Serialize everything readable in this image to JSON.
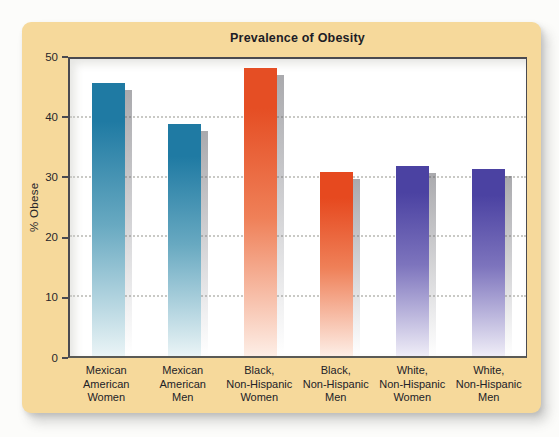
{
  "page": {
    "background": "#fcfcfa",
    "card_background": "#f6d99b"
  },
  "chart_data": {
    "type": "bar",
    "title": "Prevalence of Obesity",
    "xlabel": "",
    "ylabel": "% Obese",
    "ylim": [
      0,
      50
    ],
    "yticks": [
      0,
      10,
      20,
      30,
      40,
      50
    ],
    "gridlines_at": [
      10,
      20,
      30,
      40
    ],
    "grid_style": "dotted",
    "legend_position": "none",
    "categories": [
      "Mexican American Women",
      "Mexican American Men",
      "Black, Non-Hispanic Women",
      "Black, Non-Hispanic Men",
      "White, Non-Hispanic Women",
      "White, Non-Hispanic Men"
    ],
    "values": [
      46,
      39,
      48.5,
      31,
      32,
      31.5
    ],
    "bar_style": "vertical gradient, dark at top fading to near-white at baseline, gray drop shadow offset right-down",
    "group_colors": {
      "mexican_american": "#1f7aa3",
      "black_non_hispanic": "#e54e24",
      "white_non_hispanic": "#4b42a2"
    }
  },
  "bars": [
    {
      "label": "Mexican\nAmerican\nWomen",
      "value": 46,
      "top": "#1f7aa3",
      "mid": "#68a9c1",
      "bottom": "#eaf4f6"
    },
    {
      "label": "Mexican\nAmerican\nMen",
      "value": 39,
      "top": "#1f7aa3",
      "mid": "#68a9c1",
      "bottom": "#eaf4f6"
    },
    {
      "label": "Black,\nNon-Hispanic\nWomen",
      "value": 48.5,
      "top": "#e54e24",
      "mid": "#ef8058",
      "bottom": "#fdeee6"
    },
    {
      "label": "Black,\nNon-Hispanic\nMen",
      "value": 31,
      "top": "#e6491f",
      "mid": "#ef8058",
      "bottom": "#fdeee6"
    },
    {
      "label": "White,\nNon-Hispanic\nWomen",
      "value": 32,
      "top": "#4b42a2",
      "mid": "#7d74bd",
      "bottom": "#efedf7"
    },
    {
      "label": "White,\nNon-Hispanic\nMen",
      "value": 31.5,
      "top": "#4b42a2",
      "mid": "#7d74bd",
      "bottom": "#efedf7"
    }
  ]
}
